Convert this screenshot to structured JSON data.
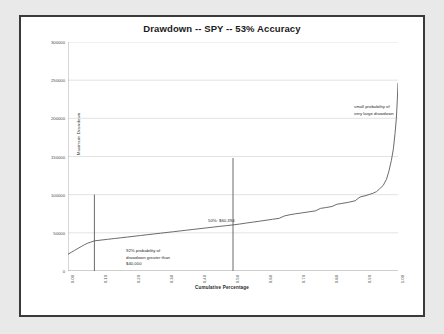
{
  "chart_data": {
    "type": "line",
    "title": "Drawdown -- SPY -- 53% Accuracy",
    "xlabel": "Cumulative Percentage",
    "ylabel": "Maximum Drawdown",
    "xlim": [
      0.0,
      1.0
    ],
    "ylim": [
      0,
      300000
    ],
    "grid": true,
    "legend": "none",
    "x_ticks": [
      "0.00",
      "0.10",
      "0.20",
      "0.30",
      "0.40",
      "0.50",
      "0.60",
      "0.70",
      "0.80",
      "0.90",
      "1.00"
    ],
    "x_tick_values": [
      0.0,
      0.1,
      0.2,
      0.3,
      0.4,
      0.5,
      0.6,
      0.7,
      0.8,
      0.9,
      1.0
    ],
    "y_ticks": [
      "0",
      "50000",
      "100000",
      "150000",
      "200000",
      "250000",
      "300000"
    ],
    "y_tick_values": [
      0,
      50000,
      100000,
      150000,
      200000,
      250000,
      300000
    ],
    "series": [
      {
        "name": "Maximum Drawdown",
        "x": [
          0.0,
          0.01,
          0.02,
          0.03,
          0.04,
          0.05,
          0.06,
          0.07,
          0.08,
          0.1,
          0.12,
          0.14,
          0.16,
          0.18,
          0.2,
          0.22,
          0.24,
          0.26,
          0.28,
          0.3,
          0.32,
          0.34,
          0.36,
          0.38,
          0.4,
          0.42,
          0.44,
          0.46,
          0.48,
          0.5,
          0.52,
          0.54,
          0.56,
          0.58,
          0.6,
          0.62,
          0.64,
          0.655,
          0.67,
          0.69,
          0.71,
          0.73,
          0.75,
          0.765,
          0.78,
          0.8,
          0.815,
          0.83,
          0.85,
          0.87,
          0.885,
          0.9,
          0.915,
          0.925,
          0.935,
          0.945,
          0.955,
          0.965,
          0.972,
          0.98,
          0.986,
          0.991,
          0.995,
          0.998,
          1.0
        ],
        "y": [
          22000,
          24500,
          27000,
          29500,
          32000,
          34500,
          36500,
          38000,
          39500,
          40500,
          41500,
          42500,
          43500,
          44500,
          45500,
          46500,
          47500,
          48500,
          49500,
          50500,
          51500,
          52500,
          53500,
          54500,
          55500,
          56500,
          57500,
          58500,
          59400,
          60394,
          61500,
          62800,
          64000,
          65200,
          66500,
          67800,
          69000,
          72000,
          73500,
          75000,
          76200,
          77500,
          78800,
          82000,
          83000,
          84500,
          87500,
          88500,
          90000,
          92000,
          97000,
          98500,
          100500,
          102000,
          104000,
          108000,
          112000,
          120000,
          130000,
          145000,
          160000,
          180000,
          200000,
          225000,
          246000
        ]
      }
    ],
    "markers": [
      {
        "name": "left-threshold-marker",
        "x": 0.08,
        "y_from": 0,
        "y_to": 100000
      },
      {
        "name": "median-marker",
        "x": 0.5,
        "y_from": 0,
        "y_to": 148000
      }
    ],
    "annotations": [
      {
        "name": "left-annotation",
        "lines": [
          "92% probability of",
          "drawdown greater than",
          "$40,000"
        ]
      },
      {
        "name": "median-annotation",
        "lines": [
          "50%: $60,394"
        ]
      },
      {
        "name": "right-annotation",
        "lines": [
          "small probability of",
          "very large drawdown"
        ]
      }
    ],
    "colors": {
      "line": "#5a5a5a",
      "grid": "#d0d0d0",
      "axis": "#9a9a9a",
      "marker": "#6a6a6a",
      "plot_background": "#ffffff",
      "page_background": "#e9e9e9",
      "frame": "#3a3a3a",
      "text": "#2a2a2a"
    }
  }
}
